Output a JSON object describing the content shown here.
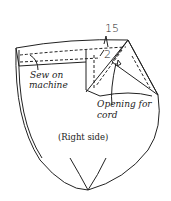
{
  "diagram": {
    "type": "sewing-instruction",
    "labels": {
      "dim_15": "15",
      "dim_2": "2",
      "sew_line1": "Sew on",
      "sew_line2": "machine",
      "opening_line1": "Opening for",
      "opening_line2": "cord",
      "side": "(Right side)"
    },
    "colors": {
      "line": "#222222",
      "background": "#ffffff"
    }
  }
}
